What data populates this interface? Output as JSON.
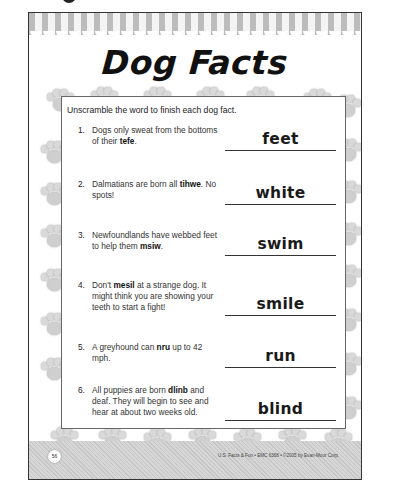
{
  "worksheet": {
    "title": "Dog Facts",
    "instructions": "Unscramble the word to finish each dog fact.",
    "items": [
      {
        "number": "1.",
        "before": "Dogs only sweat from the bottoms of their ",
        "scrambled": "tefe",
        "after": ".",
        "answer": "feet"
      },
      {
        "number": "2.",
        "before": "Dalmatians are born all ",
        "scrambled": "tihwe",
        "after": ". No spots!",
        "answer": "white"
      },
      {
        "number": "3.",
        "before": "Newfoundlands have webbed feet to help them ",
        "scrambled": "msiw",
        "after": ".",
        "answer": "swim"
      },
      {
        "number": "4.",
        "before": "Don't ",
        "scrambled": "mesil",
        "after": " at a strange dog. It might think you are showing your teeth to start a fight!",
        "answer": "smile"
      },
      {
        "number": "5.",
        "before": "A greyhound can ",
        "scrambled": "nru",
        "after": " up to 42 mph.",
        "answer": "run"
      },
      {
        "number": "6.",
        "before": "All puppies are born ",
        "scrambled": "dlinb",
        "after": " and deaf. They will begin to see and hear at about two weeks old.",
        "answer": "blind"
      }
    ],
    "footer": {
      "page_number": "56",
      "credit": "U.S. Facts & Fun • EMC 6368 • ©2005 by Evan-Moor Corp."
    }
  },
  "decor": {
    "paw_icon": "paw-print-icon",
    "colors": {
      "paw": "#cfcfcf",
      "stripe": "#bcbcbc",
      "footer_band": "#cccccc",
      "border": "#333333"
    }
  }
}
